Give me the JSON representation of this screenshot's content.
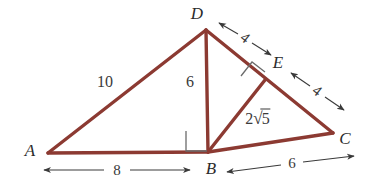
{
  "figure": {
    "type": "geometry-diagram",
    "background_color": "#ffffff",
    "stroke_color": "#8c3a32",
    "dimension_color": "#3a3a3a",
    "text_color": "#2b2b2b"
  },
  "points": {
    "A": {
      "label": "A",
      "x": 48,
      "y": 153,
      "label_x": 30,
      "label_y": 150
    },
    "B": {
      "label": "B",
      "x": 208,
      "y": 152,
      "label_x": 211,
      "label_y": 168
    },
    "C": {
      "label": "C",
      "x": 333,
      "y": 133,
      "label_x": 345,
      "label_y": 138
    },
    "D": {
      "label": "D",
      "x": 206,
      "y": 30,
      "label_x": 197,
      "label_y": 13
    },
    "E": {
      "label": "E",
      "x": 265,
      "y": 80,
      "label_x": 278,
      "label_y": 62
    }
  },
  "segments": [
    {
      "name": "AD",
      "from": "A",
      "to": "D"
    },
    {
      "name": "AB",
      "from": "A",
      "to": "B"
    },
    {
      "name": "BC",
      "from": "B",
      "to": "C"
    },
    {
      "name": "DB",
      "from": "D",
      "to": "B"
    },
    {
      "name": "DC",
      "from": "D",
      "to": "C"
    },
    {
      "name": "BE",
      "from": "B",
      "to": "E"
    }
  ],
  "side_labels": [
    {
      "name": "AD-length",
      "text": "10",
      "x": 105,
      "y": 82
    },
    {
      "name": "DB-length",
      "text": "6",
      "x": 190,
      "y": 82
    },
    {
      "name": "BE-length",
      "text": "2",
      "radicand": "5",
      "x": 258,
      "y": 118
    }
  ],
  "dimensions": [
    {
      "name": "AB-dimension",
      "text": "8",
      "x1": 42,
      "y1": 170,
      "x2": 192,
      "y2": 170,
      "label_x": 117,
      "label_y": 170,
      "rotated": false
    },
    {
      "name": "BC-dimension",
      "text": "6",
      "x1": 225,
      "y1": 172,
      "x2": 356,
      "y2": 157,
      "label_x": 292,
      "label_y": 163,
      "rotated": false
    },
    {
      "name": "DE-dimension",
      "text": "4",
      "x1": 218,
      "y1": 22,
      "x2": 272,
      "y2": 54,
      "label_x": 245,
      "label_y": 38,
      "rotated": true
    },
    {
      "name": "EC-dimension",
      "text": "4",
      "x1": 290,
      "y1": 72,
      "x2": 345,
      "y2": 110,
      "label_x": 317,
      "label_y": 91,
      "rotated": true
    }
  ],
  "right_angles": [
    {
      "name": "right-angle-at-B",
      "vertex": "B",
      "size": 20,
      "orientation": "axis-aligned"
    },
    {
      "name": "right-angle-at-E",
      "vertex": "E",
      "size": 16,
      "orientation": "rotated"
    }
  ]
}
